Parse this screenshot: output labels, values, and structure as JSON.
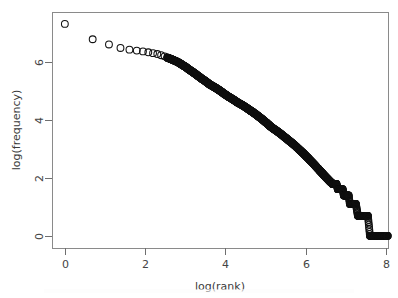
{
  "figure": {
    "background_color": "#ffffff",
    "point_color": "#101010",
    "axis_color": "#6f6f6f",
    "frame_color": "#8a8a8a",
    "width": 398,
    "height": 298
  },
  "plot_box": {
    "left": 52,
    "right": 388,
    "top": 12,
    "bottom": 248
  },
  "axes": {
    "x": {
      "title": "log(rank)",
      "ticks": [
        0,
        2,
        4,
        6,
        8
      ],
      "tick_labels": [
        "0",
        "2",
        "4",
        "6",
        "8"
      ],
      "range": [
        -0.32,
        8.05
      ]
    },
    "y": {
      "title": "log(frequency)",
      "ticks": [
        0,
        2,
        4,
        6
      ],
      "tick_labels": [
        "0",
        "2",
        "4",
        "6"
      ],
      "range": [
        -0.42,
        7.72
      ]
    }
  },
  "chart_data": {
    "type": "scatter",
    "title": "",
    "subtitle": "",
    "xlabel": "log(rank)",
    "ylabel": "log(frequency)",
    "xlim": [
      -0.32,
      8.05
    ],
    "ylim": [
      -0.42,
      7.72
    ],
    "grid": false,
    "legend": null,
    "marker": "open-circle",
    "marker_size": 3.4,
    "series": [
      {
        "name": "log(rank) vs log(frequency)",
        "x": [
          0.0,
          0.693,
          1.099,
          1.386,
          1.609,
          1.792,
          1.946,
          2.079,
          2.197,
          2.303,
          2.398,
          2.485,
          2.565,
          2.639,
          2.708,
          2.773,
          2.833,
          2.89,
          2.944,
          2.996,
          3.045,
          3.091,
          3.135,
          3.178,
          3.219,
          3.258,
          3.296,
          3.332,
          3.367,
          3.401,
          3.434,
          3.466,
          3.497,
          3.526,
          3.555,
          3.584,
          3.611,
          3.638,
          3.664,
          3.689,
          3.714,
          3.738,
          3.761,
          3.784,
          3.807,
          3.829,
          3.85,
          3.871,
          3.892,
          3.912,
          3.97,
          4.025,
          4.078,
          4.127,
          4.174,
          4.22,
          4.263,
          4.304,
          4.344,
          4.382,
          4.419,
          4.454,
          4.489,
          4.522,
          4.554,
          4.585,
          4.615,
          4.644,
          4.673,
          4.7,
          4.727,
          4.754,
          4.779,
          4.804,
          4.828,
          4.852,
          4.875,
          4.898,
          4.92,
          4.942,
          4.963,
          4.984,
          5.004,
          5.024,
          5.043,
          5.063,
          5.081,
          5.1,
          5.118,
          5.136,
          5.193,
          5.247,
          5.298,
          5.347,
          5.394,
          5.438,
          5.481,
          5.521,
          5.561,
          5.598,
          5.635,
          5.67,
          5.704,
          5.737,
          5.768,
          5.799,
          5.829,
          5.858,
          5.886,
          5.914,
          5.94,
          5.966,
          5.991,
          6.016,
          6.04,
          6.063,
          6.086,
          6.109,
          6.131,
          6.152,
          6.173,
          6.194,
          6.214,
          6.233,
          6.253,
          6.271,
          6.29,
          6.308,
          6.326,
          6.344,
          6.361,
          6.378,
          6.395,
          6.411,
          6.427,
          6.443,
          6.459,
          6.474,
          6.489,
          6.504,
          6.519,
          6.533,
          6.548,
          6.562,
          6.576,
          6.589,
          6.603,
          6.616,
          6.63,
          6.643,
          6.656,
          6.668,
          6.681,
          6.694,
          6.706,
          6.718,
          6.73,
          6.742,
          6.754,
          6.766,
          6.8,
          6.83,
          6.86,
          6.89,
          6.92,
          6.95,
          6.98,
          7.01,
          7.04,
          7.07,
          7.1,
          7.13,
          7.16,
          7.19,
          7.22,
          7.25,
          7.3,
          7.35,
          7.4,
          7.45,
          7.5,
          7.55,
          7.6,
          7.65,
          7.7,
          7.75,
          7.8,
          7.85,
          7.9,
          7.95
        ],
        "y": [
          7.31,
          6.78,
          6.6,
          6.48,
          6.42,
          6.39,
          6.36,
          6.33,
          6.3,
          6.27,
          6.23,
          6.19,
          6.14,
          6.1,
          6.06,
          6.02,
          5.98,
          5.93,
          5.88,
          5.84,
          5.79,
          5.74,
          5.7,
          5.66,
          5.62,
          5.58,
          5.54,
          5.5,
          5.47,
          5.43,
          5.4,
          5.37,
          5.34,
          5.31,
          5.28,
          5.25,
          5.22,
          5.2,
          5.18,
          5.16,
          5.14,
          5.12,
          5.1,
          5.08,
          5.06,
          5.04,
          5.02,
          5.0,
          4.98,
          4.96,
          4.9,
          4.85,
          4.8,
          4.76,
          4.72,
          4.68,
          4.64,
          4.6,
          4.57,
          4.54,
          4.51,
          4.48,
          4.45,
          4.42,
          4.39,
          4.36,
          4.33,
          4.3,
          4.28,
          4.25,
          4.22,
          4.2,
          4.17,
          4.14,
          4.12,
          4.09,
          4.07,
          4.04,
          4.02,
          3.99,
          3.97,
          3.94,
          3.92,
          3.9,
          3.87,
          3.85,
          3.83,
          3.8,
          3.78,
          3.76,
          3.7,
          3.65,
          3.6,
          3.55,
          3.5,
          3.45,
          3.4,
          3.36,
          3.31,
          3.27,
          3.23,
          3.19,
          3.15,
          3.11,
          3.07,
          3.03,
          2.99,
          2.95,
          2.92,
          2.88,
          2.85,
          2.81,
          2.78,
          2.74,
          2.71,
          2.68,
          2.64,
          2.61,
          2.58,
          2.55,
          2.52,
          2.49,
          2.46,
          2.43,
          2.4,
          2.37,
          2.34,
          2.32,
          2.29,
          2.26,
          2.24,
          2.21,
          2.19,
          2.16,
          2.14,
          2.11,
          2.09,
          2.07,
          2.04,
          2.02,
          2.0,
          1.98,
          1.96,
          1.94,
          1.92,
          1.9,
          1.88,
          1.86,
          1.85,
          1.83,
          1.81,
          1.79,
          1.79,
          1.79,
          1.79,
          1.79,
          1.79,
          1.79,
          1.79,
          1.79,
          1.61,
          1.61,
          1.61,
          1.61,
          1.61,
          1.39,
          1.39,
          1.39,
          1.39,
          1.39,
          1.1,
          1.1,
          1.1,
          1.1,
          1.1,
          1.1,
          0.69,
          0.69,
          0.69,
          0.69,
          0.69,
          0.69,
          0.0,
          0.0,
          0.0,
          0.0,
          0.0,
          0.0,
          0.0,
          0.0
        ]
      }
    ]
  }
}
